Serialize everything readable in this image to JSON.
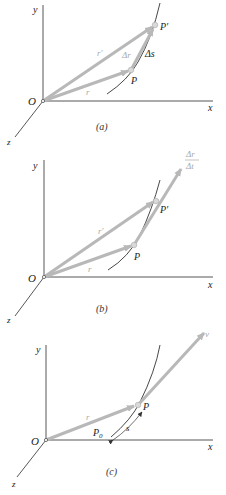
{
  "figure": {
    "colors": {
      "axis": "#444444",
      "vector": "#b8b8b8",
      "vector_label": "#a9a9a9",
      "curve": "#333333",
      "point_fill": "#d9d9d9",
      "text": "#222222"
    },
    "panels": [
      {
        "id": "a",
        "caption": "(a)",
        "axes": {
          "x": "x",
          "y": "y",
          "z": "z",
          "origin": "O"
        },
        "points": {
          "P": "P",
          "P_prime": "P′"
        },
        "vectors": {
          "r": "r",
          "r_prime": "r′",
          "delta_r": "Δr"
        },
        "arc_label": "Δs"
      },
      {
        "id": "b",
        "caption": "(b)",
        "axes": {
          "x": "x",
          "y": "y",
          "z": "z",
          "origin": "O"
        },
        "points": {
          "P": "P",
          "P_prime": "P′"
        },
        "vectors": {
          "r": "r",
          "r_prime": "r′"
        },
        "ratio": {
          "numerator": "Δr",
          "denominator": "Δt"
        }
      },
      {
        "id": "c",
        "caption": "(c)",
        "axes": {
          "x": "x",
          "y": "y",
          "z": "z",
          "origin": "O"
        },
        "points": {
          "P": "P",
          "P0": "P",
          "P0_sub": "0"
        },
        "vectors": {
          "r": "r",
          "v": "v"
        },
        "arc_label": "s"
      }
    ]
  }
}
